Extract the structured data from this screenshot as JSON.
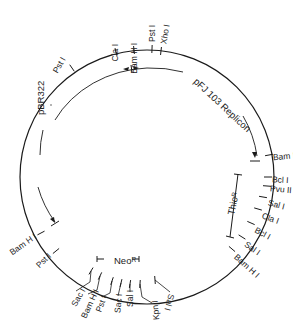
{
  "diagram": {
    "type": "plasmid-map",
    "sites_outer": [
      {
        "label": "Pst I",
        "x": 72,
        "y": 68,
        "lx": 64,
        "ly": 58,
        "rot": -60
      },
      {
        "label": "Cla I",
        "x": 116,
        "y": 52,
        "lx": 116,
        "ly": 44,
        "rot": -90
      },
      {
        "label": "Bam H I",
        "x": 134,
        "y": 50,
        "lx": 135,
        "ly": 43,
        "rot": -90
      },
      {
        "label": "Pst I",
        "x": 152,
        "y": 49,
        "lx": 153,
        "ly": 42,
        "rot": -90
      },
      {
        "label": "Xho I",
        "x": 161,
        "y": 51,
        "lx": 164,
        "ly": 44,
        "rot": -80
      },
      {
        "label": "Bam H I",
        "x": 269,
        "y": 155,
        "lx": 273,
        "ly": 158,
        "rot": -5
      },
      {
        "label": "Bcl I",
        "x": 268,
        "y": 177,
        "lx": 272,
        "ly": 180,
        "rot": 3
      },
      {
        "label": "Pvu II",
        "x": 267,
        "y": 186,
        "lx": 270,
        "ly": 189,
        "rot": 5
      },
      {
        "label": "Sal I",
        "x": 263,
        "y": 197,
        "lx": 268,
        "ly": 203,
        "rot": 15
      },
      {
        "label": "Cla I",
        "x": 258,
        "y": 209,
        "lx": 262,
        "ly": 216,
        "rot": 20
      },
      {
        "label": "Bcl I",
        "x": 251,
        "y": 223,
        "lx": 255,
        "ly": 230,
        "rot": 28
      },
      {
        "label": "Sal I",
        "x": 242,
        "y": 237,
        "lx": 245,
        "ly": 244,
        "rot": 35
      },
      {
        "label": "Bam H I",
        "x": 232,
        "y": 249,
        "lx": 235,
        "ly": 256,
        "rot": 42
      },
      {
        "label": "Bam H I",
        "x": 41,
        "y": 233,
        "lx": 36,
        "ly": 236,
        "rot": -35
      },
      {
        "label": "Pst I",
        "x": 56,
        "y": 251,
        "lx": 50,
        "ly": 255,
        "rot": -45
      }
    ],
    "sites_bottom": [
      {
        "label": "Sac I",
        "x": 91,
        "y": 271,
        "leader": [
          [
            91,
            271
          ],
          [
            90,
            282
          ],
          [
            76,
            291
          ]
        ],
        "lx": 74,
        "ly": 306,
        "rot": -60
      },
      {
        "label": "Bam H I",
        "x": 100,
        "y": 276,
        "leader": [
          [
            100,
            276
          ],
          [
            97,
            290
          ],
          [
            88,
            294
          ]
        ],
        "lx": 84,
        "ly": 318,
        "rot": -65
      },
      {
        "label": "Pst I",
        "x": 112,
        "y": 281,
        "leader": [
          [
            112,
            281
          ],
          [
            110,
            293
          ],
          [
            102,
            297
          ]
        ],
        "lx": 99,
        "ly": 312,
        "rot": -70
      },
      {
        "label": "Sac I",
        "x": 121,
        "y": 283,
        "leader": [
          [
            121,
            283
          ],
          [
            118,
            296
          ]
        ],
        "lx": 118,
        "ly": 313,
        "rot": -85
      },
      {
        "label": "Sal I",
        "x": 130,
        "y": 284,
        "leader": [
          [
            130,
            284
          ],
          [
            130,
            292
          ]
        ],
        "lx": 131,
        "ly": 307,
        "rot": -90
      },
      {
        "label": "Kpn I",
        "x": 140,
        "y": 284,
        "leader": [
          [
            140,
            284
          ],
          [
            142,
            297
          ],
          [
            152,
            303
          ]
        ],
        "lx": 157,
        "ly": 320,
        "rot": -95
      },
      {
        "label": "Sal I",
        "x": 155,
        "y": 280,
        "leader": [
          [
            155,
            280
          ],
          [
            170,
            292
          ]
        ],
        "lx": 171,
        "ly": 294,
        "rot": 105
      }
    ],
    "regions": [
      {
        "label": "pFJ 103 Replicon",
        "lx": 195,
        "ly": 80,
        "rot": 43
      },
      {
        "label": "pBR322",
        "lx": 41,
        "ly": 115,
        "rot": -90
      },
      {
        "label": "Thio",
        "sup": "R",
        "lx": 231,
        "ly": 215,
        "rot": -78
      },
      {
        "label": "Neo",
        "sup": "R",
        "lx": 114,
        "ly": 261,
        "rot": 0
      }
    ]
  }
}
